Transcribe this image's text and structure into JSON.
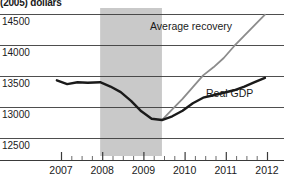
{
  "chart_data": {
    "type": "line",
    "title": "",
    "ylabel": "(2005) dollars",
    "xlabel": "",
    "grid": true,
    "legend_position": "inline-annotation",
    "ylim": [
      12250,
      14700
    ],
    "xlim": [
      2006.65,
      2012.25
    ],
    "ytick_labels": [
      "14500",
      "14000",
      "13500",
      "13000",
      "12500"
    ],
    "ytick_values": [
      14500,
      14000,
      13500,
      13000,
      12500
    ],
    "xtick_labels": [
      "2007",
      "2008",
      "2009",
      "2010",
      "2011",
      "2012"
    ],
    "xtick_values": [
      2007,
      2008,
      2009,
      2010,
      2011,
      2012
    ],
    "minor_ticks_per_year": 4,
    "recession_band": {
      "label": "recession",
      "start": 2007.95,
      "end": 2009.45,
      "color": "#c9c9c9"
    },
    "series": [
      {
        "name": "Average recovery",
        "color": "#8c8c8c",
        "label": "Average recovery",
        "x": [
          2009.45,
          2009.7,
          2009.95,
          2010.2,
          2010.45,
          2010.7,
          2010.95,
          2011.2,
          2011.45,
          2011.7,
          2011.95
        ],
        "values": [
          12790,
          12960,
          13130,
          13320,
          13510,
          13640,
          13790,
          13980,
          14150,
          14320,
          14490
        ]
      },
      {
        "name": "Real GDP",
        "color": "#1a1a1a",
        "label": "Real GDP",
        "x": [
          2006.9,
          2007.15,
          2007.4,
          2007.65,
          2007.95,
          2008.2,
          2008.45,
          2008.7,
          2008.95,
          2009.2,
          2009.45,
          2009.7,
          2009.95,
          2010.2,
          2010.45,
          2010.7,
          2010.95,
          2011.2,
          2011.45,
          2011.7,
          2011.95
        ],
        "values": [
          13430,
          13370,
          13400,
          13390,
          13400,
          13330,
          13240,
          13100,
          12930,
          12810,
          12790,
          12850,
          12940,
          13060,
          13150,
          13190,
          13230,
          13270,
          13330,
          13400,
          13470
        ]
      }
    ],
    "annotations": [
      {
        "text": "Average recovery",
        "x_px": 150,
        "y_px": 30
      },
      {
        "text": "Real GDP",
        "x_px": 206,
        "y_px": 97
      }
    ]
  }
}
